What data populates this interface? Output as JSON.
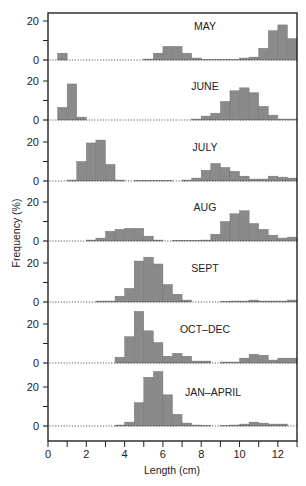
{
  "chart_data": {
    "type": "bar",
    "title": "",
    "xlabel": "Length (cm)",
    "ylabel": "Frequency (%)",
    "xlim": [
      0,
      13
    ],
    "x_ticks": [
      0,
      2,
      4,
      6,
      8,
      10,
      12
    ],
    "x_minor_ticks": [
      1,
      3,
      5,
      7,
      9,
      11,
      13
    ],
    "y_ticks": [
      0,
      20
    ],
    "bin_width_cm": 0.5,
    "bin_starts": [
      0,
      0.5,
      1,
      1.5,
      2,
      2.5,
      3,
      3.5,
      4,
      4.5,
      5,
      5.5,
      6,
      6.5,
      7,
      7.5,
      8,
      8.5,
      9,
      9.5,
      10,
      10.5,
      11,
      11.5,
      12,
      12.5
    ],
    "grid": false,
    "bar_color": "#8a8a8a",
    "panels": [
      {
        "name": "MAY",
        "values": [
          0,
          3.5,
          0,
          0,
          0,
          0,
          0,
          0,
          0,
          0,
          0.5,
          3.5,
          7,
          7,
          3.5,
          1,
          0.3,
          0.3,
          0.3,
          0.3,
          1,
          1.5,
          6,
          15,
          18,
          11,
          7.5,
          10.5
        ]
      },
      {
        "name": "JUNE",
        "values": [
          0,
          6.5,
          18.5,
          1.5,
          0,
          0,
          0,
          0,
          0,
          0,
          0,
          0,
          0,
          0,
          0,
          0.5,
          2,
          3.5,
          9.5,
          15,
          16.5,
          14,
          7,
          2.5,
          0.5,
          0.5,
          0
        ]
      },
      {
        "name": "JULY",
        "values": [
          0,
          0,
          0.5,
          10,
          19.5,
          21,
          8.5,
          0.5,
          0,
          0.3,
          0.3,
          0.3,
          0.3,
          0,
          0.5,
          1.5,
          5.5,
          9,
          7,
          5,
          2.5,
          1,
          1,
          2.5,
          2,
          1.5
        ]
      },
      {
        "name": "AUG",
        "values": [
          0,
          0,
          0,
          0,
          0.5,
          1.5,
          5,
          6,
          6.5,
          6.5,
          2.5,
          0.5,
          0,
          0.3,
          0.3,
          0.3,
          0.5,
          3.5,
          10,
          14,
          15.5,
          9,
          6,
          3,
          1.5,
          2,
          2.5
        ]
      },
      {
        "name": "SEPT",
        "values": [
          0,
          0,
          0,
          0,
          0,
          0.5,
          0.5,
          3,
          7,
          21,
          23,
          19.5,
          9,
          4,
          1,
          0,
          0,
          0,
          0.3,
          0.5,
          0.5,
          1,
          0.5,
          0.5,
          0.5,
          1
        ]
      },
      {
        "name": "OCT–DEC",
        "values": [
          0,
          0,
          0,
          0,
          0,
          0,
          0,
          3,
          13.5,
          26.5,
          16.5,
          10.5,
          3.5,
          5,
          3.5,
          1,
          1,
          0,
          0.5,
          0.5,
          2.5,
          4.5,
          4,
          1.5,
          2.5,
          2.5
        ]
      },
      {
        "name": "JAN–APRIL",
        "values": [
          0,
          0,
          0,
          0,
          0,
          0,
          0,
          0.5,
          2,
          12,
          25,
          28,
          16,
          6,
          1.5,
          0.5,
          0.3,
          0,
          0.3,
          0.5,
          1,
          2,
          1.5,
          1,
          1
        ]
      }
    ]
  }
}
